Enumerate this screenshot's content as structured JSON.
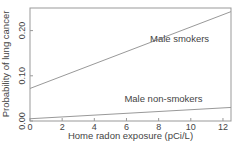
{
  "chart_data": {
    "type": "line",
    "title": "",
    "xlabel": "Home radon exposure (pCi/L)",
    "ylabel": "Probability of lung cancer",
    "xlim": [
      0,
      12.5
    ],
    "ylim": [
      0,
      0.25
    ],
    "xticks": [
      0,
      2,
      4,
      6,
      8,
      10,
      12
    ],
    "xtick_labels": [
      "0",
      "2",
      "4",
      "6",
      "8",
      "10",
      "12"
    ],
    "yticks": [
      0.0,
      0.1,
      0.2
    ],
    "ytick_labels": [
      "0.00",
      "0.10",
      "0.20"
    ],
    "grid": false,
    "legend": "none (inline labels)",
    "series": [
      {
        "name": "Male smokers",
        "x": [
          0,
          12.5
        ],
        "y": [
          0.072,
          0.242
        ],
        "label_position": {
          "x": 9.3,
          "y": 0.175
        }
      },
      {
        "name": "Male non-smokers",
        "x": [
          0,
          12.5
        ],
        "y": [
          0.005,
          0.03
        ],
        "label_position": {
          "x": 8.3,
          "y": 0.042
        }
      }
    ],
    "colors": {
      "line": "#999999",
      "axis": "#999999",
      "text": "#444444"
    }
  }
}
